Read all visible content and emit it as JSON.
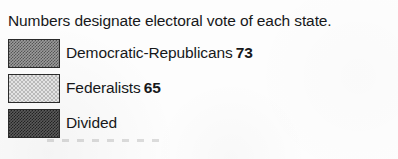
{
  "legend": {
    "title": "Numbers designate electoral vote of each state.",
    "entries": [
      {
        "swatch_name": "swatch-democratic-republicans",
        "label": "Democratic-Republicans",
        "count": "73",
        "color": "#9b9b9b",
        "pattern": "dark-dither"
      },
      {
        "swatch_name": "swatch-federalists",
        "label": "Federalists",
        "count": "65",
        "color": "#e3e3e3",
        "pattern": "light-dither"
      },
      {
        "swatch_name": "swatch-divided",
        "label": "Divided",
        "count": "",
        "color": "#5a5a5a",
        "pattern": "darkest-dither"
      }
    ]
  }
}
